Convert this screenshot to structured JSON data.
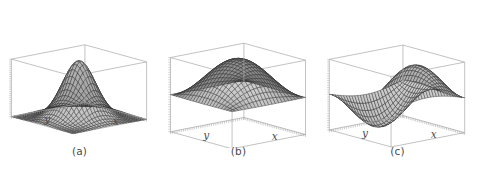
{
  "figure": {
    "background_color": "#ffffff",
    "panel_count": 3,
    "surface_fill": "#8a8a8a",
    "mesh_line_color": "#2b2b2b",
    "box_line_color": "#a8a8a8",
    "text_color": "#4a4a4a"
  },
  "panels": [
    {
      "caption": "(a)",
      "x_label": "x",
      "y_label": "y",
      "surface_name": "gaussian-bell-surface",
      "description": "single centered peak"
    },
    {
      "caption": "(b)",
      "x_label": "x",
      "y_label": "y",
      "surface_name": "cosine-dome-surface",
      "description": "dome with four descending corners"
    },
    {
      "caption": "(c)",
      "x_label": "x",
      "y_label": "y",
      "surface_name": "wave-ridge-valley-surface",
      "description": "ridge and valley wave"
    }
  ],
  "chart_data": [
    {
      "type": "surface",
      "id": "a",
      "title": "(a)",
      "xlabel": "x",
      "ylabel": "y",
      "zlabel": "",
      "xlim": [
        -3,
        3
      ],
      "ylim": [
        -3,
        3
      ],
      "zlim": [
        0,
        1
      ],
      "grid": false,
      "legend": "none",
      "formula": "exp(-(x^2+y^2)/2.2)",
      "nx": 26,
      "ny": 26,
      "z_peak": 1.0,
      "z_min": 0.0,
      "peak_location": [
        0,
        0
      ],
      "view_azimuth_deg": -50,
      "view_elevation_deg": 22
    },
    {
      "type": "surface",
      "id": "b",
      "title": "(b)",
      "xlabel": "x",
      "ylabel": "y",
      "zlabel": "",
      "xlim": [
        -1.35,
        1.35
      ],
      "ylim": [
        -1.35,
        1.35
      ],
      "zlim": [
        -1,
        1
      ],
      "grid": false,
      "legend": "none",
      "formula": "cos(1.17*x)*cos(1.17*y)",
      "nx": 22,
      "ny": 22,
      "z_peak": 1.0,
      "z_min": -1.0,
      "peak_location": [
        0,
        0
      ],
      "view_azimuth_deg": -50,
      "view_elevation_deg": 22
    },
    {
      "type": "surface",
      "id": "c",
      "title": "(c)",
      "xlabel": "x",
      "ylabel": "y",
      "zlabel": "",
      "xlim": [
        -3.1,
        3.1
      ],
      "ylim": [
        -3.1,
        3.1
      ],
      "zlim": [
        -1,
        1
      ],
      "grid": false,
      "legend": "none",
      "formula": "sin(0.95*x)*cos(0.52*y)",
      "nx": 26,
      "ny": 26,
      "z_peak": 1.0,
      "z_min": -1.0,
      "view_azimuth_deg": -50,
      "view_elevation_deg": 22
    }
  ]
}
